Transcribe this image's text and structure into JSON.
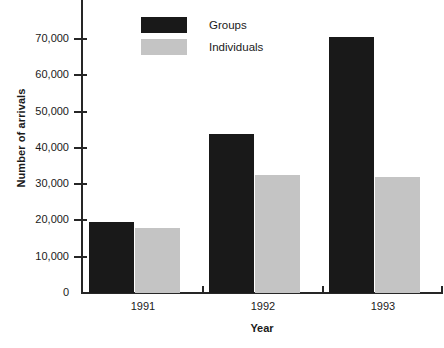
{
  "chart_data": {
    "type": "bar",
    "title": "",
    "xlabel": "Year",
    "ylabel": "Number of arrivals",
    "categories": [
      "1991",
      "1992",
      "1993"
    ],
    "series": [
      {
        "name": "Groups",
        "color": "#191919",
        "values": [
          19700,
          43900,
          70500
        ]
      },
      {
        "name": "Individuals",
        "color": "#c4c4c4",
        "values": [
          18000,
          32500,
          32000
        ]
      }
    ],
    "ylim": [
      0,
      78000
    ],
    "yticks": [
      0,
      10000,
      20000,
      30000,
      40000,
      50000,
      60000,
      70000
    ],
    "ytick_labels": [
      "0",
      "10,000",
      "20,000",
      "30,000",
      "40,000",
      "50,000",
      "60,000",
      "70,000"
    ],
    "grid": false,
    "legend_position": "top-left-inside",
    "legend": [
      {
        "label": "Groups",
        "swatch": "black-swatch"
      },
      {
        "label": "Individuals",
        "swatch": "grey-swatch"
      }
    ]
  }
}
